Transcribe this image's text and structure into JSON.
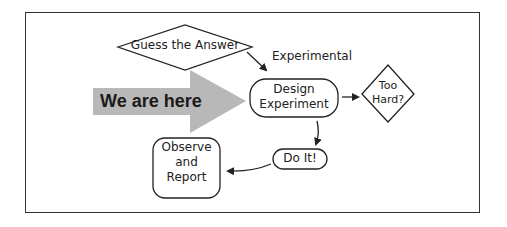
{
  "diagram": {
    "nodes": {
      "guess": {
        "label": "Guess the Answer",
        "shape": "diamond"
      },
      "design_line1": "Design",
      "design_line2": "Experiment",
      "too_hard_line1": "Too",
      "too_hard_line2": "Hard?",
      "do_it": "Do It!",
      "observe_line1": "Observe",
      "observe_line2": "and",
      "observe_line3": "Report"
    },
    "edge_labels": {
      "experimental": "Experimental"
    },
    "marker": {
      "label": "We are here",
      "color": "#b8b8b8"
    },
    "colors": {
      "stroke": "#222222",
      "frame": "#333333",
      "background": "#ffffff"
    }
  }
}
